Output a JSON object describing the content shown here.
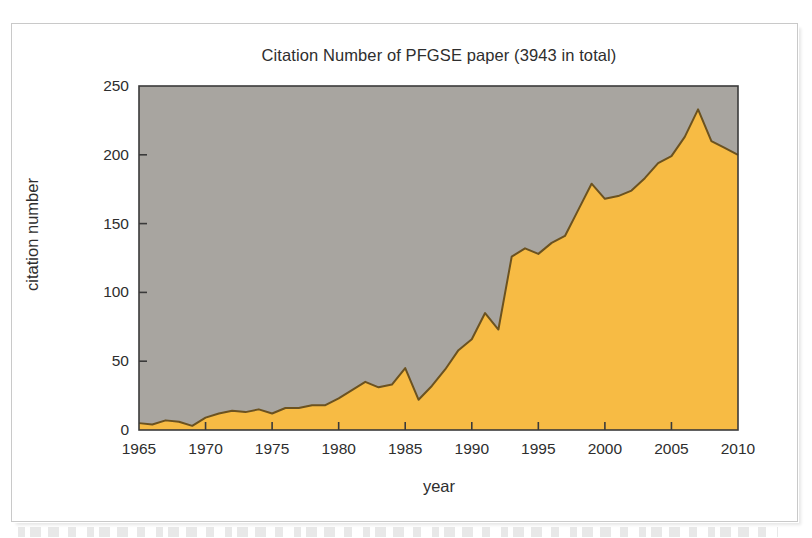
{
  "figure": {
    "title": "Citation Number of PFGSE paper (3943 in total)",
    "xlabel": "year",
    "ylabel": "citation number"
  },
  "colors": {
    "plot_background": "#a8a5a0",
    "area_fill": "#f7bb44",
    "line": "#6b5220",
    "axis": "#3a3a3a",
    "text": "#2e2e2e",
    "page_border": "#c9c9c9"
  },
  "chart_data": {
    "type": "area",
    "title": "Citation Number of PFGSE paper (3943 in total)",
    "xlabel": "year",
    "ylabel": "citation number",
    "xlim": [
      1965,
      2010
    ],
    "ylim": [
      0,
      250
    ],
    "xticks": [
      1965,
      1970,
      1975,
      1980,
      1985,
      1990,
      1995,
      2000,
      2005,
      2010
    ],
    "yticks": [
      0,
      50,
      100,
      150,
      200,
      250
    ],
    "grid": false,
    "legend": null,
    "total_citations": 3943,
    "x": [
      1965,
      1966,
      1967,
      1968,
      1969,
      1970,
      1971,
      1972,
      1973,
      1974,
      1975,
      1976,
      1977,
      1978,
      1979,
      1980,
      1981,
      1982,
      1983,
      1984,
      1985,
      1986,
      1987,
      1988,
      1989,
      1990,
      1991,
      1992,
      1993,
      1994,
      1995,
      1996,
      1997,
      1998,
      1999,
      2000,
      2001,
      2002,
      2003,
      2004,
      2005,
      2006,
      2007,
      2008,
      2009,
      2010
    ],
    "values": [
      5,
      4,
      7,
      6,
      3,
      9,
      12,
      14,
      13,
      15,
      12,
      16,
      16,
      18,
      18,
      23,
      29,
      35,
      31,
      33,
      45,
      22,
      32,
      44,
      58,
      66,
      85,
      73,
      126,
      132,
      128,
      136,
      141,
      160,
      179,
      168,
      170,
      174,
      183,
      194,
      199,
      213,
      233,
      210,
      205,
      200
    ],
    "series": [
      {
        "name": "citation number",
        "values": [
          5,
          4,
          7,
          6,
          3,
          9,
          12,
          14,
          13,
          15,
          12,
          16,
          16,
          18,
          18,
          23,
          29,
          35,
          31,
          33,
          45,
          22,
          32,
          44,
          58,
          66,
          85,
          73,
          126,
          132,
          128,
          136,
          141,
          160,
          179,
          168,
          170,
          174,
          183,
          194,
          199,
          213,
          233,
          210,
          205,
          200
        ]
      }
    ]
  },
  "ytick_labels": [
    "250",
    "200",
    "150",
    "100",
    "50",
    "0"
  ],
  "xtick_labels": [
    "1965",
    "1970",
    "1975",
    "1980",
    "1985",
    "1990",
    "1995",
    "2000",
    "2005",
    "2010"
  ]
}
